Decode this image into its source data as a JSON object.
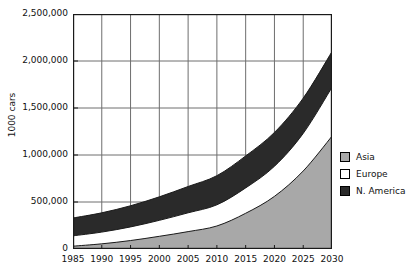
{
  "chart_data": {
    "type": "area",
    "stacked": true,
    "title": "",
    "xlabel": "",
    "ylabel": "1000 cars",
    "x": [
      1985,
      1990,
      1995,
      2000,
      2005,
      2010,
      2015,
      2020,
      2025,
      2030
    ],
    "categories": [
      "1985",
      "1990",
      "1995",
      "2000",
      "2005",
      "2010",
      "2015",
      "2020",
      "2025",
      "2030"
    ],
    "series": [
      {
        "name": "Asia",
        "color": "#a8a8a8",
        "values": [
          30000,
          55000,
          90000,
          135000,
          185000,
          245000,
          380000,
          560000,
          830000,
          1200000
        ]
      },
      {
        "name": "Europe",
        "color": "#ffffff",
        "values": [
          110000,
          125000,
          145000,
          170000,
          200000,
          225000,
          270000,
          320000,
          400000,
          520000
        ]
      },
      {
        "name": "N. America",
        "color": "#2a2a2a",
        "values": [
          190000,
          205000,
          225000,
          250000,
          280000,
          310000,
          340000,
          360000,
          375000,
          380000
        ]
      }
    ],
    "cumulative_tops": {
      "Asia": [
        30000,
        55000,
        90000,
        135000,
        185000,
        245000,
        380000,
        560000,
        830000,
        1200000
      ],
      "Europe": [
        140000,
        180000,
        235000,
        305000,
        385000,
        470000,
        650000,
        880000,
        1230000,
        1720000
      ],
      "N. America": [
        330000,
        385000,
        460000,
        555000,
        665000,
        780000,
        990000,
        1240000,
        1605000,
        2100000
      ]
    },
    "ytick_labels": [
      "2,500,000",
      "2,000,000",
      "1,500,000",
      "1,000,000",
      "500,000",
      "0"
    ],
    "ytick_values": [
      2500000,
      2000000,
      1500000,
      1000000,
      500000,
      0
    ],
    "ylim": [
      0,
      2500000
    ],
    "xlim": [
      1985,
      2030
    ],
    "grid": true,
    "legend_position": "right"
  },
  "legend": {
    "items": [
      {
        "label": "Asia",
        "color": "#a8a8a8"
      },
      {
        "label": "Europe",
        "color": "#ffffff"
      },
      {
        "label": "N. America",
        "color": "#2a2a2a"
      }
    ]
  },
  "colors": {
    "asia": "#a8a8a8",
    "europe": "#ffffff",
    "north_america": "#2a2a2a",
    "axis": "#1a1a1a",
    "grid": "#6e6e6e",
    "text": "#111111"
  }
}
